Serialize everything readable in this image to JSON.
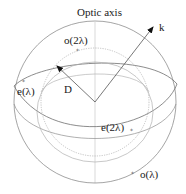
{
  "figure": {
    "title": "Optic axis",
    "labels": {
      "optic_axis": "Optic axis",
      "k": "k",
      "D": "D",
      "o_2lambda": "o(2λ)",
      "e_lambda": "e(λ)",
      "e_2lambda": "e(2λ)",
      "o_lambda": "o(λ)"
    },
    "vectors": [
      {
        "name": "k",
        "description": "wave vector"
      },
      {
        "name": "D",
        "description": "displacement vector"
      }
    ],
    "surfaces": [
      {
        "name": "o(λ)",
        "type": "outer sphere"
      },
      {
        "name": "e(λ)",
        "type": "outer ellipsoid"
      },
      {
        "name": "o(2λ)",
        "type": "inner sphere (dotted)"
      },
      {
        "name": "e(2λ)",
        "type": "inner ellipsoid"
      }
    ],
    "colors": {
      "line": "#9a9a9a",
      "dark_line": "#6e6e6e",
      "dotted": "#b4b4b4",
      "text": "#1a1a1a"
    }
  }
}
